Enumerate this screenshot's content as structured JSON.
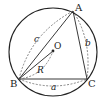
{
  "diagram": {
    "type": "circumscribed-circle-triangle",
    "points": {
      "A": {
        "label": "A"
      },
      "B": {
        "label": "B"
      },
      "C": {
        "label": "C"
      },
      "O": {
        "label": "O"
      }
    },
    "sides": {
      "a": {
        "label": "a"
      },
      "b": {
        "label": "b"
      },
      "c": {
        "label": "c"
      }
    },
    "radius": {
      "label": "R"
    },
    "colors": {
      "stroke": "#222222",
      "background": "#ffffff"
    }
  }
}
